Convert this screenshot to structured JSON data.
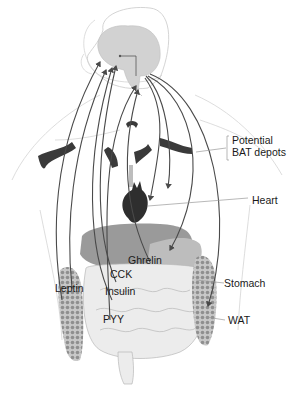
{
  "diagram": {
    "labels": {
      "bat": "Potential\nBAT depots",
      "heart": "Heart",
      "ghrelin": "Ghrelin",
      "cck": "CCK",
      "leptin": "Leptin",
      "insulin": "Insulin",
      "stomach": "Stomach",
      "pyy": "PYY",
      "wat": "WAT"
    },
    "colors": {
      "brain": "#d2d2d2",
      "brain_outline": "#bdbdbd",
      "bat": "#3a3a3a",
      "heart": "#2e2e2e",
      "liver": "#9a9a9a",
      "stomach": "#bdbdbd",
      "intestine": "#ececec",
      "wat": "#a8a8a8",
      "arrow": "#4a4a4a",
      "body_outline": "#cfcfcf",
      "leader": "#9a9a9a"
    }
  }
}
